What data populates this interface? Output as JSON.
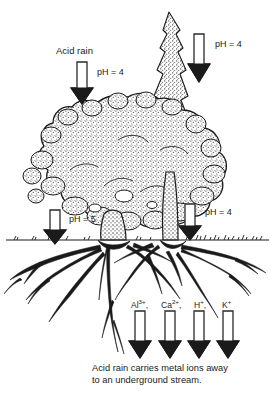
{
  "figure": {
    "colors": {
      "ink": "#1a1a1a",
      "paper": "#ffffff",
      "foliage_stipple": "#3a3a3a",
      "arrow_outline": "#2a2a2a",
      "arrow_fill": "#ffffff"
    }
  },
  "labels": {
    "acid_rain": "Acid rain",
    "ph_top_left": "pH = 4",
    "ph_top_right": "pH = 4",
    "ph_ground_left": "pH = 5",
    "ph_ground_right": "pH = 4"
  },
  "ions": [
    {
      "name": "aluminium-ion",
      "element": "Al",
      "charge": "3+",
      "trailing": ","
    },
    {
      "name": "calcium-ion",
      "element": "Ca",
      "charge": "2+",
      "trailing": ","
    },
    {
      "name": "hydrogen-ion",
      "element": "H",
      "charge": "+",
      "trailing": ","
    },
    {
      "name": "potassium-ion",
      "element": "K",
      "charge": "+",
      "trailing": ""
    }
  ],
  "caption": {
    "line1": "Acid rain carries metal ions away",
    "line2": "to an underground stream.",
    "full": "Acid rain carries metal ions away to an underground stream."
  },
  "arrows": {
    "rain_top_left": {
      "x": 82,
      "y_top": 62,
      "y_bottom": 104
    },
    "rain_top_right": {
      "x": 199,
      "y_top": 34,
      "y_bottom": 82
    },
    "rain_ground_left": {
      "x": 55,
      "y_top": 210,
      "y_bottom": 244
    },
    "rain_ground_right": {
      "x": 190,
      "y_top": 204,
      "y_bottom": 240
    },
    "ion_outflow": [
      {
        "x": 140,
        "y_top": 311,
        "y_bottom": 358
      },
      {
        "x": 170,
        "y_top": 311,
        "y_bottom": 358
      },
      {
        "x": 199,
        "y_top": 311,
        "y_bottom": 358
      },
      {
        "x": 228,
        "y_top": 311,
        "y_bottom": 358
      }
    ]
  },
  "scene": {
    "ground_line_y": 240,
    "canopy_description": "Broad stippled deciduous canopy with tall narrow conifer spire at upper right",
    "root_description": "Wide spreading root system below ground line with taproot"
  }
}
